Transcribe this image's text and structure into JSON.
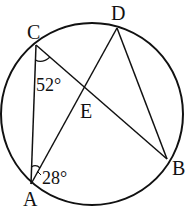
{
  "figure": {
    "type": "circle-geometry",
    "circle": {
      "cx": 92,
      "cy": 114,
      "r": 91
    },
    "points": {
      "A": {
        "label": "A",
        "x": 31,
        "y": 184
      },
      "B": {
        "label": "B",
        "x": 167,
        "y": 159
      },
      "C": {
        "label": "C",
        "x": 36,
        "y": 45
      },
      "D": {
        "label": "D",
        "x": 117,
        "y": 28
      },
      "E": {
        "label": "E",
        "x": 84,
        "y": 87
      }
    },
    "segments": [
      "CA",
      "CB",
      "AD",
      "DB"
    ],
    "angles": [
      {
        "vertex": "C",
        "value": "52°"
      },
      {
        "vertex": "A",
        "value": "28°"
      }
    ],
    "stroke_color": "#111111"
  }
}
